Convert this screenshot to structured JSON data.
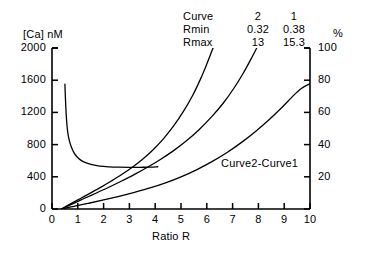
{
  "chart_data": {
    "type": "line",
    "title": "",
    "xlabel": "Ratio R",
    "ylabel": "[Ca] nM",
    "y2label": "%",
    "xlim": [
      0,
      10
    ],
    "ylim": [
      0,
      2000
    ],
    "y2lim": [
      0,
      100
    ],
    "grid": false,
    "legend_position": "top-right",
    "xticks": [
      0,
      1,
      2,
      3,
      4,
      5,
      6,
      7,
      8,
      9,
      10
    ],
    "xtick_labels": [
      "0",
      "1",
      "2",
      "3",
      "4",
      "5",
      "6",
      "7",
      "8",
      "9",
      "10"
    ],
    "yticks": [
      0,
      400,
      800,
      1200,
      1600,
      2000
    ],
    "ytick_labels": [
      "0",
      "400",
      "800",
      "1200",
      "1600",
      "2000"
    ],
    "y2ticks": [
      0,
      20,
      40,
      60,
      80,
      100
    ],
    "y2tick_labels": [
      "0",
      "20",
      "40",
      "60",
      "80",
      "100"
    ],
    "annotations": [
      {
        "text": "Curve2-Curve1",
        "x": 6.55,
        "y": 560
      }
    ],
    "series": [
      {
        "name": "decay",
        "axis": "left",
        "points": [
          [
            0.5,
            1550
          ],
          [
            0.52,
            1380
          ],
          [
            0.55,
            1180
          ],
          [
            0.58,
            1040
          ],
          [
            0.62,
            930
          ],
          [
            0.68,
            840
          ],
          [
            0.75,
            770
          ],
          [
            0.85,
            700
          ],
          [
            0.95,
            655
          ],
          [
            1.1,
            610
          ],
          [
            1.3,
            575
          ],
          [
            1.55,
            550
          ],
          [
            1.85,
            533
          ],
          [
            2.2,
            524
          ],
          [
            2.6,
            519
          ],
          [
            3.0,
            517
          ],
          [
            3.4,
            518
          ],
          [
            3.8,
            521
          ],
          [
            4.1,
            525
          ]
        ]
      },
      {
        "name": "curve2",
        "axis": "left",
        "points": [
          [
            0.36,
            0
          ],
          [
            0.7,
            60
          ],
          [
            1.1,
            130
          ],
          [
            1.5,
            200
          ],
          [
            1.9,
            272
          ],
          [
            2.3,
            348
          ],
          [
            2.7,
            428
          ],
          [
            3.1,
            516
          ],
          [
            3.5,
            615
          ],
          [
            3.9,
            730
          ],
          [
            4.3,
            865
          ],
          [
            4.7,
            1025
          ],
          [
            5.1,
            1215
          ],
          [
            5.45,
            1410
          ],
          [
            5.75,
            1610
          ],
          [
            6.0,
            1800
          ],
          [
            6.2,
            1965
          ],
          [
            6.28,
            2030
          ]
        ]
      },
      {
        "name": "curve1",
        "axis": "left",
        "points": [
          [
            0.38,
            0
          ],
          [
            0.75,
            58
          ],
          [
            1.2,
            124
          ],
          [
            1.7,
            196
          ],
          [
            2.2,
            270
          ],
          [
            2.7,
            348
          ],
          [
            3.2,
            430
          ],
          [
            3.7,
            518
          ],
          [
            4.2,
            615
          ],
          [
            4.7,
            722
          ],
          [
            5.2,
            845
          ],
          [
            5.7,
            985
          ],
          [
            6.2,
            1150
          ],
          [
            6.65,
            1320
          ],
          [
            7.05,
            1500
          ],
          [
            7.4,
            1680
          ],
          [
            7.7,
            1855
          ],
          [
            7.95,
            2010
          ],
          [
            8.02,
            2055
          ]
        ]
      },
      {
        "name": "difference",
        "axis": "left",
        "points": [
          [
            0.37,
            0
          ],
          [
            0.8,
            30
          ],
          [
            1.4,
            70
          ],
          [
            2.0,
            112
          ],
          [
            2.6,
            158
          ],
          [
            3.2,
            208
          ],
          [
            3.8,
            262
          ],
          [
            4.4,
            325
          ],
          [
            5.0,
            400
          ],
          [
            5.6,
            487
          ],
          [
            6.2,
            588
          ],
          [
            6.8,
            705
          ],
          [
            7.4,
            840
          ],
          [
            7.9,
            966
          ],
          [
            8.4,
            1105
          ],
          [
            8.9,
            1258
          ],
          [
            9.3,
            1390
          ],
          [
            9.65,
            1495
          ],
          [
            10.0,
            1555
          ]
        ]
      }
    ]
  },
  "axes": {
    "y_left_title": "[Ca] nM",
    "y_right_title": "%",
    "x_title": "Ratio R"
  },
  "legend": {
    "rows": [
      {
        "label": "Curve",
        "col2": "2",
        "col1": "1"
      },
      {
        "label": "Rmin",
        "col2": "0.32",
        "col1": "0.38"
      },
      {
        "label": "Rmax",
        "col2": "13",
        "col1": "15.3"
      }
    ]
  },
  "colors": {
    "line": "#000000",
    "axis": "#000000",
    "background": "#ffffff"
  }
}
